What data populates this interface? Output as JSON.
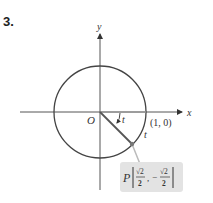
{
  "problem_number": "3.",
  "labels": {
    "x_axis": "x",
    "y_axis": "y",
    "origin": "O",
    "point_one_zero": "(1, 0)",
    "arc_t": "t",
    "angle_t": "t",
    "point_name": "P",
    "point_x_num": "√2",
    "point_x_den": "2",
    "point_y_sign": "−",
    "point_y_num": "√2",
    "point_y_den": "2"
  },
  "colors": {
    "circle": "#444444",
    "radius_line": "#555555",
    "axis": "#555555",
    "point_box": "#e3e3e3",
    "point": "#777777"
  }
}
